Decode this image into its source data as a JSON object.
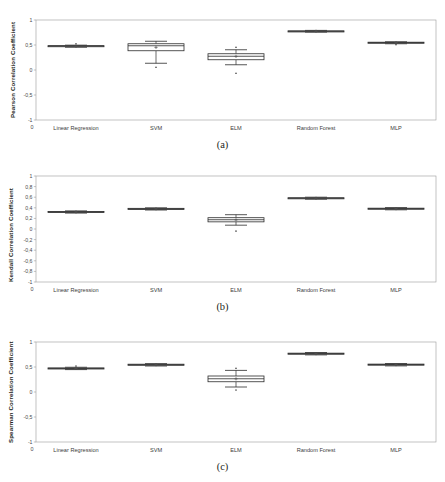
{
  "figure": {
    "panels": [
      {
        "id": "a",
        "caption": "(a)",
        "ylabel": "Pearson Correlation Coefficient"
      },
      {
        "id": "b",
        "caption": "(b)",
        "ylabel": "Kendall Correlation Coefficient"
      },
      {
        "id": "c",
        "caption": "(c)",
        "ylabel": "Spearman Correlation Coefficient"
      }
    ],
    "origin_label": "0"
  },
  "chart_data": [
    {
      "type": "box",
      "panel": "a",
      "title": "",
      "xlabel": "",
      "ylabel": "Pearson Correlation Coefficient",
      "ylim": [
        -1,
        1
      ],
      "yticks": [
        1,
        0.5,
        0,
        -0.5,
        -1
      ],
      "ytick_labels": [
        "1",
        "0,5",
        "0",
        "-0,5",
        "-1"
      ],
      "grid": false,
      "legend": "none",
      "categories": [
        "Linear Regression",
        "SVM",
        "ELM",
        "Random Forest",
        "MLP"
      ],
      "boxes": [
        {
          "label": "Linear Regression",
          "min": 0.455,
          "q1": 0.468,
          "median": 0.478,
          "q3": 0.487,
          "max": 0.497,
          "mean": 0.476,
          "outliers": [
            0.525
          ]
        },
        {
          "label": "SVM",
          "min": 0.135,
          "q1": 0.385,
          "median": 0.485,
          "q3": 0.525,
          "max": 0.575,
          "mean": 0.452,
          "outliers": [
            0.055
          ]
        },
        {
          "label": "ELM",
          "min": 0.105,
          "q1": 0.205,
          "median": 0.275,
          "q3": 0.325,
          "max": 0.405,
          "mean": 0.272,
          "outliers": [
            0.455,
            -0.065
          ]
        },
        {
          "label": "Random Forest",
          "min": 0.758,
          "q1": 0.768,
          "median": 0.775,
          "q3": 0.783,
          "max": 0.792,
          "mean": 0.775,
          "outliers": []
        },
        {
          "label": "MLP",
          "min": 0.525,
          "q1": 0.538,
          "median": 0.548,
          "q3": 0.556,
          "max": 0.565,
          "mean": 0.547,
          "outliers": [
            0.508
          ]
        }
      ]
    },
    {
      "type": "box",
      "panel": "b",
      "title": "",
      "xlabel": "",
      "ylabel": "Kendall Correlation Coefficient",
      "ylim": [
        -1,
        1
      ],
      "yticks": [
        1,
        0.8,
        0.6,
        0.4,
        0.2,
        0,
        -0.2,
        -0.4,
        -0.6,
        -0.8,
        -1
      ],
      "ytick_labels": [
        "1",
        "0,8",
        "0,6",
        "0,4",
        "0,2",
        "0",
        "-0,2",
        "-0,4",
        "-0,6",
        "-0,8",
        "-1"
      ],
      "grid": false,
      "legend": "none",
      "categories": [
        "Linear Regression",
        "SVM",
        "ELM",
        "Random Forest",
        "MLP"
      ],
      "boxes": [
        {
          "label": "Linear Regression",
          "min": 0.3,
          "q1": 0.313,
          "median": 0.322,
          "q3": 0.331,
          "max": 0.342,
          "mean": 0.322,
          "outliers": []
        },
        {
          "label": "SVM",
          "min": 0.358,
          "q1": 0.371,
          "median": 0.381,
          "q3": 0.39,
          "max": 0.4,
          "mean": 0.38,
          "outliers": []
        },
        {
          "label": "ELM",
          "min": 0.072,
          "q1": 0.135,
          "median": 0.175,
          "q3": 0.213,
          "max": 0.27,
          "mean": 0.172,
          "outliers": [
            -0.04
          ]
        },
        {
          "label": "Random Forest",
          "min": 0.562,
          "q1": 0.573,
          "median": 0.581,
          "q3": 0.59,
          "max": 0.6,
          "mean": 0.58,
          "outliers": []
        },
        {
          "label": "MLP",
          "min": 0.362,
          "q1": 0.375,
          "median": 0.384,
          "q3": 0.393,
          "max": 0.404,
          "mean": 0.383,
          "outliers": []
        }
      ]
    },
    {
      "type": "box",
      "panel": "c",
      "title": "",
      "xlabel": "",
      "ylabel": "Spearman Correlation Coefficient",
      "ylim": [
        -1,
        1
      ],
      "yticks": [
        1,
        0.5,
        0,
        -0.5,
        -1
      ],
      "ytick_labels": [
        "1",
        "0,5",
        "0",
        "-0,5",
        "-1"
      ],
      "grid": false,
      "legend": "none",
      "categories": [
        "Linear Regression",
        "SVM",
        "ELM",
        "Random Forest",
        "MLP"
      ],
      "boxes": [
        {
          "label": "Linear Regression",
          "min": 0.448,
          "q1": 0.462,
          "median": 0.472,
          "q3": 0.482,
          "max": 0.495,
          "mean": 0.472,
          "outliers": [
            0.52
          ]
        },
        {
          "label": "SVM",
          "min": 0.52,
          "q1": 0.535,
          "median": 0.546,
          "q3": 0.556,
          "max": 0.568,
          "mean": 0.545,
          "outliers": []
        },
        {
          "label": "ELM",
          "min": 0.1,
          "q1": 0.205,
          "median": 0.265,
          "q3": 0.32,
          "max": 0.432,
          "mean": 0.264,
          "outliers": [
            0.475,
            0.04
          ]
        },
        {
          "label": "Random Forest",
          "min": 0.742,
          "q1": 0.757,
          "median": 0.767,
          "q3": 0.777,
          "max": 0.79,
          "mean": 0.766,
          "outliers": []
        },
        {
          "label": "MLP",
          "min": 0.522,
          "q1": 0.537,
          "median": 0.548,
          "q3": 0.558,
          "max": 0.57,
          "mean": 0.547,
          "outliers": []
        }
      ]
    }
  ]
}
